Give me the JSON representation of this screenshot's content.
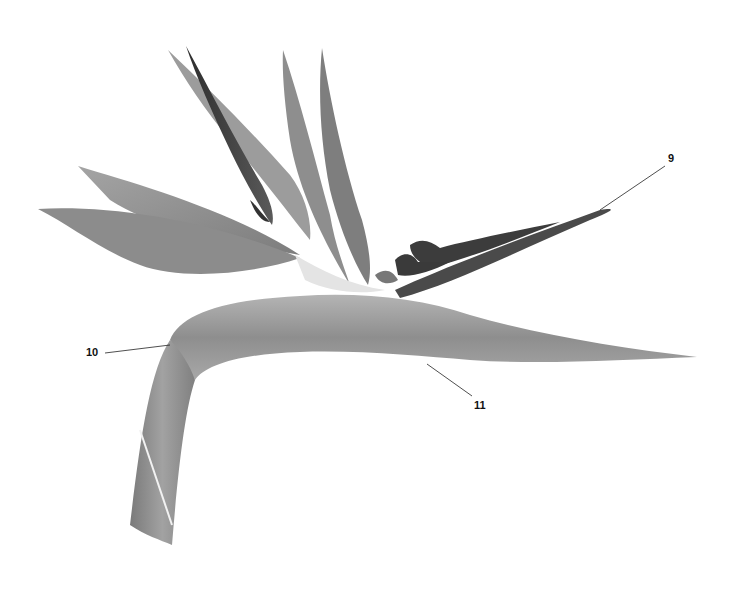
{
  "figure": {
    "colors": {
      "background": "#ffffff",
      "leaf": "#8a8a8a",
      "leaf_dark": "#3a3a3a",
      "stem": "#9a9a9a",
      "label": "#111111"
    }
  },
  "callouts": [
    {
      "id": "9",
      "label": "9",
      "x": 671,
      "y": 154,
      "target": [
        600,
        210
      ]
    },
    {
      "id": "10",
      "label": "10",
      "x": 88,
      "y": 348,
      "target": [
        170,
        345
      ]
    },
    {
      "id": "11",
      "label": "11",
      "x": 476,
      "y": 401,
      "target": [
        427,
        364
      ]
    }
  ]
}
